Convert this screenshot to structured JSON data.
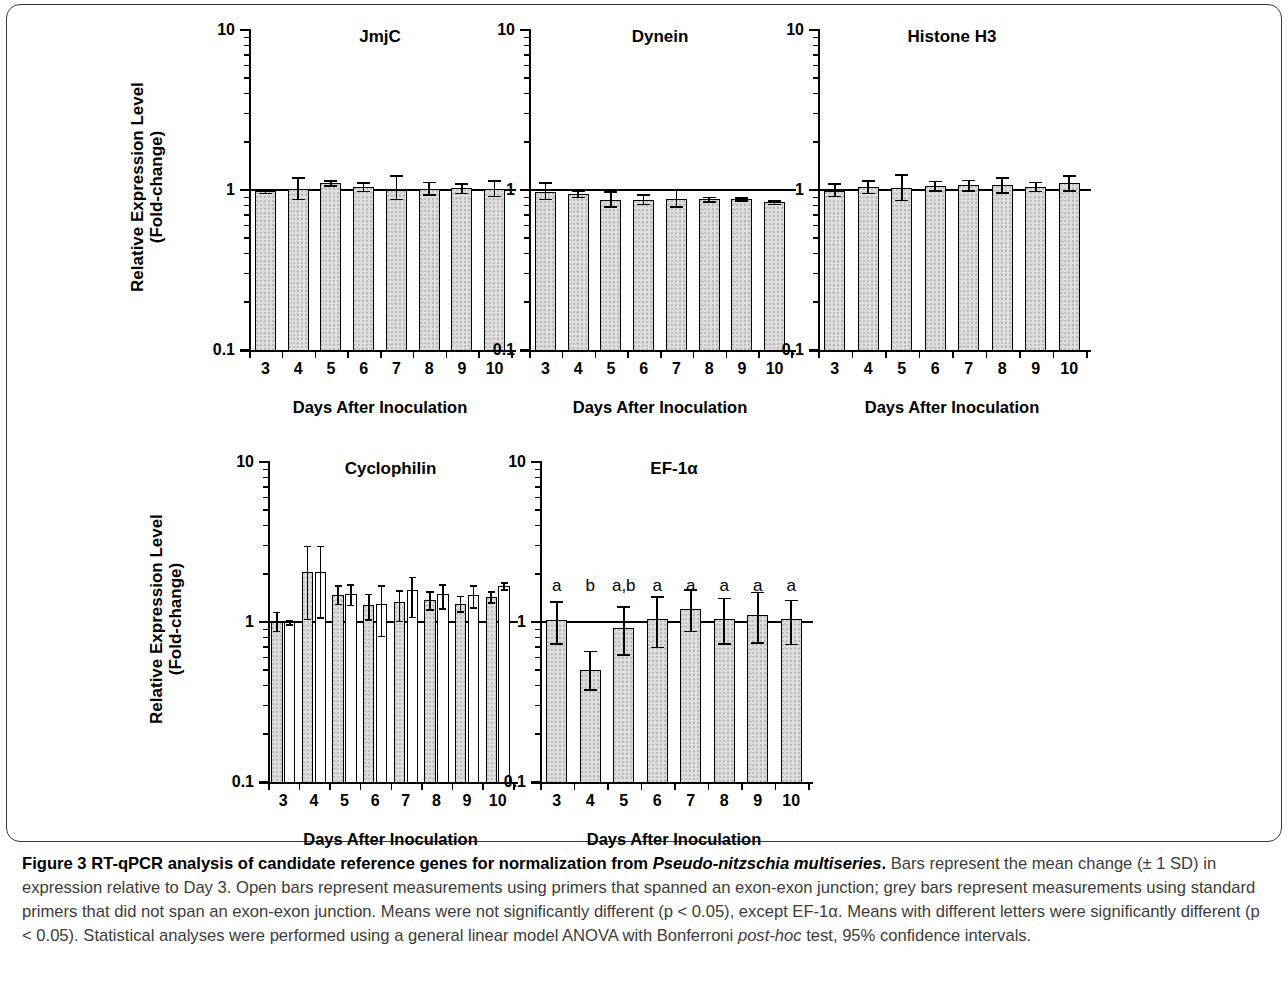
{
  "figure": {
    "caption_label": "Figure 3",
    "caption_title": "RT-qPCR analysis of candidate reference genes for normalization from ",
    "caption_species": "Pseudo-nitzschia multiseries",
    "caption_title_end": ".",
    "caption_body_1": " Bars represent the mean change (± 1 SD) in expression relative to Day 3. Open bars represent measurements using primers that spanned an exon-exon junction; grey bars represent measurements using standard primers that did not span an exon-exon junction. Means were not significantly different (p < 0.05), except EF-1α. Means with different letters were significantly different (p < 0.05). Statistical analyses were performed using a general linear model ANOVA with Bonferroni ",
    "caption_italic_1": "post-hoc",
    "caption_body_2": " test, 95% confidence intervals."
  },
  "axes": {
    "y_title_line1": "Relative Expression Level",
    "y_title_line2": "(Fold-change)",
    "x_title": "Days After Inoculation",
    "y_ticks": [
      "10",
      "1",
      "0.1"
    ],
    "x_ticks": [
      "3",
      "4",
      "5",
      "6",
      "7",
      "8",
      "9",
      "10"
    ]
  },
  "chart_data": [
    {
      "type": "bar",
      "title": "JmjC",
      "xlabel": "Days After Inoculation",
      "ylabel": "Relative Expression Level (Fold-change)",
      "yscale": "log",
      "ylim": [
        0.1,
        10
      ],
      "baseline": 1,
      "categories": [
        "3",
        "4",
        "5",
        "6",
        "7",
        "8",
        "9",
        "10"
      ],
      "series": [
        {
          "name": "grey (standard primers)",
          "fill": "grey",
          "values": [
            0.98,
            1.01,
            1.1,
            1.05,
            1.0,
            1.02,
            1.03,
            1.02
          ],
          "err_upper": [
            1.01,
            1.2,
            1.15,
            1.12,
            1.24,
            1.13,
            1.1,
            1.15
          ],
          "err_lower": [
            0.96,
            0.88,
            1.07,
            0.99,
            0.88,
            0.94,
            0.96,
            0.92
          ]
        }
      ]
    },
    {
      "type": "bar",
      "title": "Dynein",
      "xlabel": "Days After Inoculation",
      "ylabel": "Relative Expression Level (Fold-change)",
      "yscale": "log",
      "ylim": [
        0.1,
        10
      ],
      "baseline": 1,
      "categories": [
        "3",
        "4",
        "5",
        "6",
        "7",
        "8",
        "9",
        "10"
      ],
      "series": [
        {
          "name": "grey (standard primers)",
          "fill": "grey",
          "values": [
            0.97,
            0.95,
            0.86,
            0.87,
            0.88,
            0.88,
            0.88,
            0.84
          ],
          "err_upper": [
            1.12,
            1.0,
            0.98,
            0.94,
            1.02,
            0.91,
            0.9,
            0.86
          ],
          "err_lower": [
            0.88,
            0.91,
            0.79,
            0.82,
            0.79,
            0.85,
            0.86,
            0.82
          ]
        }
      ]
    },
    {
      "type": "bar",
      "title": "Histone H3",
      "xlabel": "Days After Inoculation",
      "ylabel": "Relative Expression Level (Fold-change)",
      "yscale": "log",
      "ylim": [
        0.1,
        10
      ],
      "baseline": 1,
      "categories": [
        "3",
        "4",
        "5",
        "6",
        "7",
        "8",
        "9",
        "10"
      ],
      "series": [
        {
          "name": "grey (standard primers)",
          "fill": "grey",
          "values": [
            0.98,
            1.04,
            1.03,
            1.06,
            1.07,
            1.07,
            1.05,
            1.1
          ],
          "err_upper": [
            1.1,
            1.15,
            1.25,
            1.14,
            1.16,
            1.2,
            1.13,
            1.24
          ],
          "err_lower": [
            0.92,
            0.96,
            0.87,
            1.0,
            1.0,
            0.97,
            0.99,
            1.0
          ]
        }
      ]
    },
    {
      "type": "bar",
      "title": "Cyclophilin",
      "xlabel": "Days After Inoculation",
      "ylabel": "Relative Expression Level (Fold-change)",
      "yscale": "log",
      "ylim": [
        0.1,
        10
      ],
      "baseline": 1,
      "categories": [
        "3",
        "4",
        "5",
        "6",
        "7",
        "8",
        "9",
        "10"
      ],
      "series": [
        {
          "name": "grey (standard primers)",
          "fill": "grey",
          "values": [
            1.0,
            2.05,
            1.48,
            1.28,
            1.33,
            1.38,
            1.29,
            1.44
          ],
          "err_upper": [
            1.16,
            3.0,
            1.7,
            1.5,
            1.58,
            1.56,
            1.46,
            1.56
          ],
          "err_lower": [
            0.88,
            1.05,
            1.3,
            1.04,
            1.02,
            1.2,
            1.17,
            1.33
          ]
        },
        {
          "name": "open (exon-exon junction primers)",
          "fill": "open",
          "values": [
            1.0,
            2.05,
            1.5,
            1.3,
            1.58,
            1.5,
            1.47,
            1.68
          ],
          "err_upper": [
            1.03,
            3.0,
            1.72,
            1.7,
            1.92,
            1.73,
            1.7,
            1.78
          ],
          "err_lower": [
            0.97,
            1.07,
            1.28,
            0.82,
            1.08,
            1.22,
            1.24,
            1.6
          ]
        }
      ]
    },
    {
      "type": "bar",
      "title": "EF-1α",
      "xlabel": "Days After Inoculation",
      "ylabel": "Relative Expression Level (Fold-change)",
      "yscale": "log",
      "ylim": [
        0.1,
        10
      ],
      "baseline": 1,
      "categories": [
        "3",
        "4",
        "5",
        "6",
        "7",
        "8",
        "9",
        "10"
      ],
      "significance_letters": [
        "a",
        "b",
        "a,b",
        "a",
        "a",
        "a",
        "a",
        "a"
      ],
      "series": [
        {
          "name": "grey (standard primers)",
          "fill": "grey",
          "values": [
            1.03,
            0.5,
            0.92,
            1.04,
            1.2,
            1.05,
            1.1,
            1.04
          ],
          "err_upper": [
            1.35,
            0.66,
            1.25,
            1.45,
            1.6,
            1.42,
            1.55,
            1.38
          ],
          "err_lower": [
            0.74,
            0.38,
            0.63,
            0.7,
            0.88,
            0.74,
            0.75,
            0.73
          ]
        }
      ]
    }
  ]
}
